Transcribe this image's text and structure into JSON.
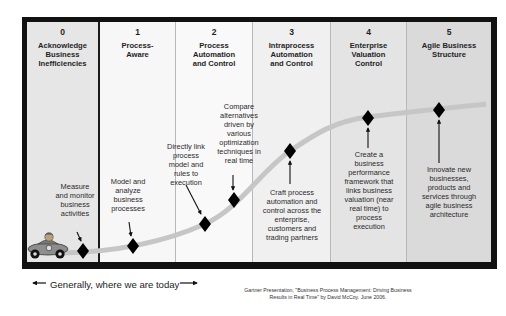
{
  "stages": [
    {
      "number": "0",
      "title": "Acknowledge Business Inefficiencies",
      "title_lines": [
        "Acknowledge",
        "Business",
        "Inefficiencies"
      ]
    },
    {
      "number": "1",
      "title": "Process-Aware",
      "title_lines": [
        "Process-",
        "Aware"
      ]
    },
    {
      "number": "2",
      "title": "Process Automation and Control",
      "title_lines": [
        "Process",
        "Automation",
        "and Control"
      ]
    },
    {
      "number": "3",
      "title": "Intraprocess Automation and Control",
      "title_lines": [
        "Intraprocess",
        "Automation",
        "and Control"
      ]
    },
    {
      "number": "4",
      "title": "Enterprise Valuation Control",
      "title_lines": [
        "Enterprise",
        "Valuation",
        "Control"
      ]
    },
    {
      "number": "5",
      "title": "Agile Business Structure",
      "title_lines": [
        "Agile Business",
        "Structure"
      ]
    }
  ],
  "annotations": [
    {
      "id": "measure",
      "text": "Measure and monitor business activities",
      "lines": [
        "Measure",
        "and monitor",
        "business",
        "activities"
      ]
    },
    {
      "id": "model",
      "text": "Model and analyze business processes",
      "lines": [
        "Model and",
        "analyze",
        "business",
        "processes"
      ]
    },
    {
      "id": "link",
      "text": "Directly link process model and rules to execution",
      "lines": [
        "Directly link",
        "process",
        "model and",
        "rules to",
        "execution"
      ]
    },
    {
      "id": "compare",
      "text": "Compare alternatives driven by various optimization techniques in real time",
      "lines": [
        "Compare",
        "alternatives",
        "driven by",
        "various",
        "optimization",
        "techniques in",
        "real time"
      ]
    },
    {
      "id": "craft",
      "text": "Craft process automation and control across the enterprise, customers and trading partners",
      "lines": [
        "Craft process",
        "automation and",
        "control across the",
        "enterprise,",
        "customers and",
        "trading partners"
      ]
    },
    {
      "id": "create",
      "text": "Create a business performance framework that links business valuation (near real time) to process execution",
      "lines": [
        "Create a",
        "business",
        "performance",
        "framework that",
        "links business",
        "valuation (near",
        "real time) to",
        "process",
        "execution"
      ]
    },
    {
      "id": "innovate",
      "text": "Innovate new businesses, products and services through agile business architecture",
      "lines": [
        "Innovate new",
        "businesses,",
        "products and",
        "services through",
        "agile business",
        "architecture"
      ]
    }
  ],
  "milestones": [
    {
      "x": 83,
      "y": 251
    },
    {
      "x": 133,
      "y": 246
    },
    {
      "x": 205,
      "y": 224
    },
    {
      "x": 234,
      "y": 200
    },
    {
      "x": 290,
      "y": 151
    },
    {
      "x": 368,
      "y": 118
    },
    {
      "x": 439,
      "y": 110
    }
  ],
  "footer": {
    "today_label": "Generally, where we are today",
    "citation_line1": "Gartner Presentation, \"Business Process Management: Driving Business",
    "citation_line2": "Results in Real Time\" by David McCoy. June 2006."
  },
  "colors": {
    "frame": "#111111",
    "curve": "#c8c8c8",
    "diamond": "#000000",
    "col_bg": [
      "#e6e6e6",
      "#f7f7f7",
      "#f9f9f9",
      "#f0f0f0",
      "#e4e4e4",
      "#dadada"
    ]
  }
}
